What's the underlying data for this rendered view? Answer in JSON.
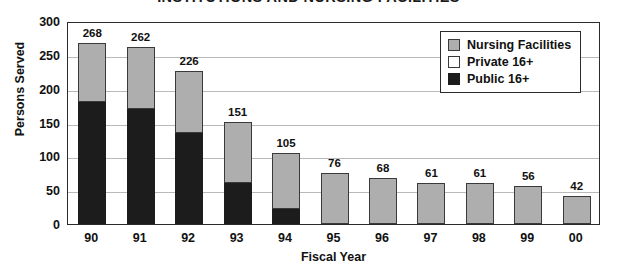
{
  "chart_data": {
    "type": "bar",
    "stacked": true,
    "title": "INSTITUTIONS AND NURSING FACILITIES",
    "xlabel": "Fiscal Year",
    "ylabel": "Persons Served",
    "categories": [
      "90",
      "91",
      "92",
      "93",
      "94",
      "95",
      "96",
      "97",
      "98",
      "99",
      "00"
    ],
    "series": [
      {
        "name": "Public 16+",
        "color": "#1c1c1c",
        "values": [
          180,
          170,
          135,
          60,
          22,
          0,
          0,
          0,
          0,
          0,
          0
        ]
      },
      {
        "name": "Private 16+",
        "color": "#ffffff",
        "values": [
          0,
          0,
          0,
          0,
          0,
          0,
          0,
          0,
          0,
          0,
          0
        ]
      },
      {
        "name": "Nursing Facilities",
        "color": "#aeaeae",
        "values": [
          88,
          92,
          91,
          91,
          83,
          76,
          68,
          61,
          61,
          56,
          42
        ]
      }
    ],
    "totals": [
      268,
      262,
      226,
      151,
      105,
      76,
      68,
      61,
      61,
      56,
      42
    ],
    "yticks": [
      0,
      50,
      100,
      150,
      200,
      250,
      300
    ],
    "ylim": [
      0,
      300
    ],
    "grid": true,
    "legend_position": "top-right"
  },
  "legend": {
    "items": [
      {
        "label": "Nursing Facilities",
        "swatch": "sw-nursing"
      },
      {
        "label": "Private 16+",
        "swatch": "sw-private"
      },
      {
        "label": "Public 16+",
        "swatch": "sw-public"
      }
    ]
  }
}
